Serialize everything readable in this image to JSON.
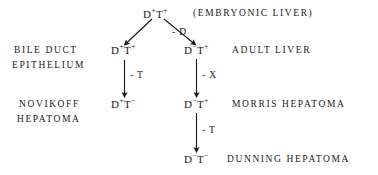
{
  "diagram": {
    "title_caption": "(EMBRYONIC LIVER)",
    "nodes": {
      "embryonic": {
        "base1": "D",
        "sup1": "+",
        "base2": "T",
        "sup2": "+"
      },
      "bile_duct": {
        "base1": "D",
        "sup1": "+",
        "base2": "T",
        "sup2": "+"
      },
      "adult_liver": {
        "base1": "D",
        "sup1": "−",
        "base2": "T",
        "sup2": "+"
      },
      "novikoff": {
        "base1": "D",
        "sup1": "+",
        "base2": "T",
        "sup2": "−"
      },
      "morris": {
        "base1": "D",
        "sup1": "−",
        "base2": "T",
        "sup2": "+"
      },
      "dunning": {
        "base1": "D",
        "sup1": "−",
        "base2": "T",
        "sup2": "−"
      }
    },
    "side_labels": {
      "bile_duct_line1": "BILE  DUCT",
      "bile_duct_line2": "EPITHELIUM",
      "novikoff_line1": "NOVIKOFF",
      "novikoff_line2": "HEPATOMA"
    },
    "right_labels": {
      "adult_liver": "ADULT   LIVER",
      "morris": "MORRIS   HEPATOMA",
      "dunning": "DUNNING  HEPATOMA"
    },
    "edge_labels": {
      "to_adult_liver": "- D",
      "bile_to_novikoff": "- T",
      "adult_to_morris": "- X",
      "morris_to_dunning": "- T"
    },
    "colors": {
      "ink": "#1a1a1a",
      "background": "#ffffff"
    }
  }
}
